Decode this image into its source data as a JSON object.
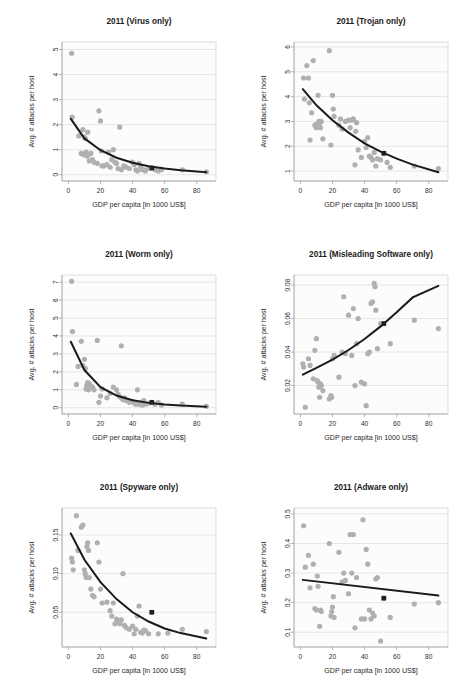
{
  "figure": {
    "panel_count": 6,
    "shared_xlabel": "GDP per capita [in 1000 US$]",
    "shared_ylabel": "Avg. # attacks per host",
    "point_color": "#b0b0b0",
    "fit_color": "#1a1a1a",
    "highlight_color": "#1f1f1f",
    "plot_bg": "#fcfcfc",
    "grid_color": "#dddddd"
  },
  "chart_data": [
    {
      "type": "scatter",
      "id": "virus",
      "title": "2011 (Virus only)",
      "xlabel": "GDP per capita [in 1000 US$]",
      "ylabel": "Avg. # attacks per host",
      "xlim": [
        -4,
        92
      ],
      "ylim": [
        -0.25,
        5.3
      ],
      "xticks": [
        0,
        20,
        40,
        60,
        80
      ],
      "yticks": [
        0,
        1,
        2,
        3,
        4,
        5
      ],
      "grid": true,
      "legend": "none",
      "x": [
        2.0,
        2.3,
        6.5,
        8.0,
        9.0,
        9.5,
        10.0,
        10.5,
        11.0,
        11.5,
        12.0,
        12.5,
        13.0,
        14.0,
        15.0,
        16.0,
        18.0,
        19.0,
        20.0,
        20.5,
        21.0,
        22.0,
        24.0,
        25.0,
        26.0,
        27.0,
        28.0,
        29.0,
        30.0,
        31.0,
        32.0,
        33.0,
        34.5,
        36.0,
        38.0,
        40.0,
        41.0,
        42.0,
        43.0,
        44.0,
        45.0,
        46.0,
        47.0,
        48.0,
        50.0,
        52.0,
        54.0,
        56.0,
        58.0,
        71.0,
        86.0
      ],
      "y": [
        4.85,
        2.3,
        1.55,
        0.85,
        1.8,
        0.8,
        1.5,
        1.45,
        0.9,
        0.75,
        1.7,
        0.8,
        0.55,
        0.85,
        0.6,
        0.5,
        0.45,
        2.55,
        2.15,
        0.95,
        0.35,
        0.35,
        0.4,
        0.9,
        0.3,
        0.6,
        1.0,
        0.5,
        0.45,
        0.25,
        1.9,
        0.2,
        0.35,
        0.3,
        0.25,
        0.5,
        0.4,
        0.2,
        0.15,
        0.45,
        0.3,
        0.2,
        0.2,
        0.15,
        0.25,
        0.25,
        0.2,
        0.15,
        0.2,
        0.2,
        0.12
      ],
      "fit": {
        "kind": "exponential_decay",
        "points_x": [
          1.5,
          10,
          20,
          30,
          40,
          50,
          60,
          70,
          86
        ],
        "points_y": [
          2.23,
          1.45,
          0.98,
          0.68,
          0.48,
          0.34,
          0.25,
          0.18,
          0.1
        ]
      },
      "highlight": {
        "x": 52,
        "y": 0.27,
        "label": "mean"
      }
    },
    {
      "type": "scatter",
      "id": "trojan",
      "title": "2011 (Trojan only)",
      "xlabel": "GDP per capita [in 1000 US$]",
      "ylabel": "Avg. # attacks per host",
      "xlim": [
        -4,
        92
      ],
      "ylim": [
        0.6,
        6.2
      ],
      "xticks": [
        0,
        20,
        40,
        60,
        80
      ],
      "yticks": [
        1,
        2,
        3,
        4,
        5,
        6
      ],
      "grid": true,
      "legend": "none",
      "x": [
        2.0,
        2.5,
        4.0,
        5.0,
        5.5,
        6.0,
        7.0,
        8.0,
        9.0,
        10.0,
        10.5,
        11.0,
        11.5,
        12.0,
        12.5,
        13.0,
        14.0,
        18.0,
        19.0,
        20.0,
        20.5,
        21.0,
        24.0,
        25.0,
        26.0,
        28.0,
        30.0,
        31.0,
        32.0,
        33.0,
        34.0,
        34.5,
        35.0,
        36.0,
        38.0,
        40.0,
        41.0,
        42.0,
        43.0,
        44.0,
        45.0,
        46.0,
        47.0,
        48.0,
        50.0,
        52.0,
        54.0,
        56.0,
        71.0,
        86.0
      ],
      "y": [
        4.75,
        3.9,
        5.25,
        4.75,
        3.75,
        2.25,
        3.35,
        5.45,
        2.85,
        2.75,
        2.9,
        4.05,
        3.0,
        2.95,
        2.75,
        3.0,
        2.3,
        5.85,
        2.05,
        4.05,
        3.5,
        3.2,
        2.85,
        3.1,
        2.7,
        3.0,
        3.05,
        2.75,
        3.05,
        3.1,
        1.25,
        2.6,
        2.95,
        1.85,
        1.55,
        2.2,
        1.95,
        2.35,
        1.6,
        1.55,
        1.45,
        1.75,
        1.2,
        1.5,
        1.45,
        1.7,
        1.35,
        1.15,
        1.2,
        1.1
      ],
      "fit": {
        "kind": "exponential_decay",
        "points_x": [
          1.5,
          10,
          20,
          30,
          40,
          50,
          60,
          70,
          86
        ],
        "points_y": [
          4.3,
          3.65,
          3.05,
          2.55,
          2.12,
          1.78,
          1.5,
          1.26,
          0.95
        ]
      },
      "highlight": {
        "x": 52,
        "y": 1.72,
        "label": "mean"
      }
    },
    {
      "type": "scatter",
      "id": "worm",
      "title": "2011 (Worm only)",
      "xlabel": "GDP per capita [in 1000 US$]",
      "ylabel": "Avg. # attacks per host",
      "xlim": [
        -4,
        92
      ],
      "ylim": [
        -0.35,
        7.4
      ],
      "xticks": [
        0,
        20,
        40,
        60,
        80
      ],
      "yticks": [
        0,
        1,
        2,
        3,
        4,
        5,
        6,
        7
      ],
      "grid": true,
      "legend": "none",
      "x": [
        2.0,
        2.5,
        5.0,
        6.0,
        8.0,
        9.0,
        10.0,
        10.5,
        11.0,
        11.5,
        12.0,
        12.5,
        13.0,
        14.0,
        15.0,
        16.0,
        18.0,
        19.0,
        20.0,
        21.0,
        24.0,
        26.0,
        28.0,
        30.0,
        31.0,
        32.0,
        33.0,
        34.0,
        35.0,
        36.0,
        38.0,
        40.0,
        41.0,
        42.0,
        43.0,
        44.0,
        45.0,
        46.0,
        47.0,
        48.0,
        50.0,
        52.0,
        54.0,
        56.0,
        58.0,
        71.0,
        86.0
      ],
      "y": [
        7.05,
        4.25,
        1.3,
        2.3,
        3.7,
        2.35,
        2.7,
        2.2,
        1.05,
        1.25,
        1.4,
        1.0,
        1.35,
        1.2,
        1.15,
        1.0,
        3.75,
        0.3,
        0.65,
        1.05,
        0.55,
        0.8,
        1.15,
        1.0,
        0.75,
        0.6,
        3.45,
        0.45,
        0.55,
        0.4,
        0.3,
        0.35,
        0.25,
        0.2,
        1.0,
        0.2,
        0.3,
        0.15,
        0.4,
        0.2,
        0.25,
        0.3,
        0.2,
        0.3,
        0.15,
        0.2,
        0.08
      ],
      "fit": {
        "kind": "exponential_decay",
        "points_x": [
          1.5,
          10,
          20,
          30,
          40,
          50,
          60,
          70,
          86
        ],
        "points_y": [
          3.68,
          2.1,
          1.15,
          0.68,
          0.42,
          0.27,
          0.18,
          0.12,
          0.06
        ]
      },
      "highlight": {
        "x": 52,
        "y": 0.3,
        "label": "mean"
      }
    },
    {
      "type": "scatter",
      "id": "misleading-software",
      "title": "2011 (Misleading Software only)",
      "xlabel": "GDP per capita [in 1000 US$]",
      "ylabel": "Avg. # attacks per host",
      "xlim": [
        -4,
        92
      ],
      "ylim": [
        0.003,
        0.086
      ],
      "xticks": [
        0,
        20,
        40,
        60,
        80
      ],
      "yticks": [
        0.02,
        0.04,
        0.06,
        0.08
      ],
      "ytick_labels": [
        "0.02",
        "0.04",
        "0.06",
        "0.08"
      ],
      "grid": true,
      "legend": "none",
      "x": [
        1.5,
        2.0,
        3.0,
        5.0,
        6.0,
        8.0,
        9.0,
        10.0,
        10.5,
        11.0,
        11.5,
        12.0,
        12.5,
        13.0,
        14.0,
        18.0,
        19.0,
        19.5,
        20.0,
        21.0,
        24.0,
        26.0,
        27.0,
        28.0,
        30.0,
        32.0,
        33.0,
        34.0,
        35.0,
        36.0,
        38.0,
        40.0,
        41.0,
        42.0,
        43.0,
        44.0,
        45.0,
        46.0,
        46.5,
        47.0,
        48.0,
        50.0,
        52.0,
        56.0,
        71.0,
        86.0
      ],
      "y": [
        0.033,
        0.031,
        0.007,
        0.036,
        0.032,
        0.024,
        0.041,
        0.048,
        0.023,
        0.022,
        0.019,
        0.013,
        0.021,
        0.02,
        0.017,
        0.012,
        0.014,
        0.013,
        0.036,
        0.038,
        0.025,
        0.04,
        0.073,
        0.039,
        0.062,
        0.038,
        0.066,
        0.02,
        0.045,
        0.06,
        0.022,
        0.021,
        0.008,
        0.039,
        0.04,
        0.069,
        0.07,
        0.081,
        0.079,
        0.065,
        0.042,
        0.057,
        0.057,
        0.045,
        0.059,
        0.054
      ],
      "fit": {
        "kind": "exponential_growth",
        "points_x": [
          1.5,
          10,
          20,
          30,
          40,
          50,
          60,
          70,
          86
        ],
        "points_y": [
          0.0265,
          0.0305,
          0.0355,
          0.0412,
          0.0478,
          0.0553,
          0.0637,
          0.0726,
          0.0795
        ]
      },
      "highlight": {
        "x": 52,
        "y": 0.057,
        "label": "mean"
      }
    },
    {
      "type": "scatter",
      "id": "spyware",
      "title": "2011 (Spyware only)",
      "xlabel": "GDP per capita [in 1000 US$]",
      "ylabel": "Avg. # attacks per host",
      "xlim": [
        -4,
        92
      ],
      "ylim": [
        0.005,
        0.185
      ],
      "xticks": [
        0,
        20,
        40,
        60,
        80
      ],
      "yticks": [
        0.05,
        0.1,
        0.15
      ],
      "ytick_labels": [
        "0.05",
        "0.10",
        "0.15"
      ],
      "grid": true,
      "legend": "none",
      "x": [
        2.0,
        2.5,
        3.0,
        5.0,
        6.0,
        8.0,
        9.0,
        10.0,
        10.5,
        11.0,
        11.5,
        12.0,
        12.5,
        13.0,
        14.0,
        15.0,
        16.0,
        18.0,
        19.0,
        20.0,
        21.0,
        24.0,
        26.0,
        27.0,
        28.0,
        29.0,
        30.0,
        31.0,
        32.0,
        33.0,
        34.0,
        35.0,
        36.0,
        38.0,
        40.0,
        41.0,
        42.0,
        43.0,
        44.0,
        45.0,
        46.0,
        47.0,
        48.0,
        50.0,
        52.0,
        56.0,
        62.0,
        71.0,
        86.0
      ],
      "y": [
        0.12,
        0.115,
        0.105,
        0.175,
        0.13,
        0.16,
        0.163,
        0.105,
        0.1,
        0.095,
        0.135,
        0.14,
        0.13,
        0.095,
        0.08,
        0.072,
        0.07,
        0.14,
        0.115,
        0.08,
        0.062,
        0.063,
        0.052,
        0.045,
        0.062,
        0.035,
        0.041,
        0.038,
        0.035,
        0.04,
        0.1,
        0.033,
        0.03,
        0.028,
        0.032,
        0.022,
        0.028,
        0.045,
        0.058,
        0.024,
        0.023,
        0.027,
        0.026,
        0.022,
        0.05,
        0.022,
        0.023,
        0.028,
        0.025
      ],
      "fit": {
        "kind": "exponential_decay",
        "points_x": [
          1.5,
          10,
          20,
          30,
          40,
          50,
          60,
          70,
          86
        ],
        "points_y": [
          0.152,
          0.118,
          0.089,
          0.067,
          0.05,
          0.038,
          0.029,
          0.023,
          0.016
        ]
      },
      "highlight": {
        "x": 52,
        "y": 0.05,
        "label": "mean"
      }
    },
    {
      "type": "scatter",
      "id": "adware",
      "title": "2011 (Adware only)",
      "xlabel": "GDP per capita [in 1000 US$]",
      "ylabel": "Avg. # attacks per host",
      "xlim": [
        -4,
        92
      ],
      "ylim": [
        0.05,
        0.52
      ],
      "xticks": [
        0,
        20,
        40,
        60,
        80
      ],
      "yticks": [
        0.1,
        0.2,
        0.3,
        0.4,
        0.5
      ],
      "ytick_labels": [
        "0.1",
        "0.2",
        "0.3",
        "0.4",
        "0.5"
      ],
      "grid": true,
      "legend": "none",
      "x": [
        2.0,
        3.0,
        5.0,
        6.0,
        8.0,
        9.0,
        10.0,
        10.5,
        11.0,
        12.0,
        12.5,
        13.0,
        18.0,
        19.0,
        19.5,
        20.0,
        20.5,
        21.0,
        24.0,
        26.0,
        27.0,
        28.0,
        30.0,
        31.0,
        32.0,
        33.0,
        34.0,
        35.0,
        38.0,
        39.0,
        40.0,
        41.0,
        42.0,
        43.0,
        44.0,
        45.0,
        46.0,
        47.0,
        48.0,
        50.0,
        52.0,
        56.0,
        71.0,
        86.0
      ],
      "y": [
        0.46,
        0.32,
        0.36,
        0.25,
        0.33,
        0.18,
        0.175,
        0.29,
        0.255,
        0.12,
        0.175,
        0.17,
        0.4,
        0.155,
        0.17,
        0.185,
        0.22,
        0.15,
        0.37,
        0.27,
        0.3,
        0.275,
        0.23,
        0.43,
        0.3,
        0.43,
        0.115,
        0.285,
        0.145,
        0.48,
        0.145,
        0.38,
        0.33,
        0.175,
        0.145,
        0.165,
        0.155,
        0.28,
        0.285,
        0.07,
        0.215,
        0.15,
        0.195,
        0.2
      ],
      "fit": {
        "kind": "linear",
        "points_x": [
          1.5,
          86
        ],
        "points_y": [
          0.277,
          0.224
        ]
      },
      "highlight": {
        "x": 52,
        "y": 0.215,
        "label": "mean"
      }
    }
  ]
}
